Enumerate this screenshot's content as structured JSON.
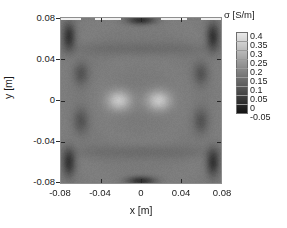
{
  "figure": {
    "type": "pseudocolor-map",
    "colormap": "grayscale"
  },
  "axes": {
    "xlabel": "x [m]",
    "ylabel": "y [m]",
    "xticks": [
      "-0.08",
      "-0.04",
      "0",
      "0.04",
      "0.08"
    ],
    "yticks": [
      "0.08",
      "0.04",
      "0",
      "-0.04",
      "-0.08"
    ],
    "xlim": [
      -0.08,
      0.08
    ],
    "ylim": [
      -0.08,
      0.08
    ]
  },
  "colorbar": {
    "title": "σ [S/m]",
    "ticks": [
      "0.4",
      "0.35",
      "0.3",
      "0.25",
      "0.2",
      "0.15",
      "0.1",
      "0.05",
      "0",
      "-0.05"
    ],
    "vmin": -0.05,
    "vmax": 0.4,
    "low_color": "#141414",
    "high_color": "#e8e8e8"
  },
  "chart_data": {
    "type": "heatmap",
    "title": "",
    "xlabel": "x [m]",
    "ylabel": "y [m]",
    "zlabel": "σ [S/m]",
    "xlim": [
      -0.08,
      0.08
    ],
    "ylim": [
      -0.08,
      0.08
    ],
    "zlim": [
      -0.05,
      0.4
    ],
    "colormap": "gray",
    "grid": false,
    "legend": "colorbar-right",
    "background_value": 0.17,
    "features": [
      {
        "name": "inclusion-left",
        "cx": -0.022,
        "cy": 0.0,
        "rx": 0.011,
        "ry": 0.009,
        "peak_value": 0.33
      },
      {
        "name": "inclusion-right",
        "cx": 0.018,
        "cy": 0.0,
        "rx": 0.011,
        "ry": 0.009,
        "peak_value": 0.33
      },
      {
        "name": "electrode-left-upper",
        "cx": -0.072,
        "cy": 0.062,
        "rx": 0.006,
        "ry": 0.012,
        "peak_value": 0.02
      },
      {
        "name": "electrode-left-lower",
        "cx": -0.072,
        "cy": -0.06,
        "rx": 0.006,
        "ry": 0.012,
        "peak_value": 0.02
      },
      {
        "name": "electrode-right-upper",
        "cx": 0.072,
        "cy": 0.062,
        "rx": 0.006,
        "ry": 0.012,
        "peak_value": 0.02
      },
      {
        "name": "electrode-right-lower",
        "cx": 0.072,
        "cy": -0.06,
        "rx": 0.006,
        "ry": 0.012,
        "peak_value": 0.02
      },
      {
        "name": "artifact-left-inner-upper",
        "cx": -0.06,
        "cy": 0.026,
        "rx": 0.007,
        "ry": 0.01,
        "peak_value": 0.09
      },
      {
        "name": "artifact-left-inner-lower",
        "cx": -0.06,
        "cy": -0.02,
        "rx": 0.007,
        "ry": 0.011,
        "peak_value": 0.09
      },
      {
        "name": "artifact-right-inner-upper",
        "cx": 0.06,
        "cy": 0.026,
        "rx": 0.007,
        "ry": 0.01,
        "peak_value": 0.09
      },
      {
        "name": "artifact-right-inner-lower",
        "cx": 0.06,
        "cy": -0.02,
        "rx": 0.007,
        "ry": 0.011,
        "peak_value": 0.09
      },
      {
        "name": "electrode-top-center",
        "cx": 0.0,
        "cy": 0.078,
        "rx": 0.013,
        "ry": 0.004,
        "peak_value": 0.01
      },
      {
        "name": "electrode-bottom-center",
        "cx": 0.0,
        "cy": -0.078,
        "rx": 0.013,
        "ry": 0.004,
        "peak_value": 0.01
      },
      {
        "name": "band-upper",
        "cy": 0.05,
        "half_height": 0.007,
        "peak_value": 0.135
      },
      {
        "name": "band-lower",
        "cy": -0.05,
        "half_height": 0.007,
        "peak_value": 0.135
      }
    ]
  }
}
